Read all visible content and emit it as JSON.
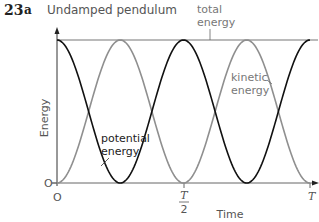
{
  "figure": {
    "number": "23",
    "part": "a",
    "title": "Undamped pendulum"
  },
  "chart_data": {
    "type": "line",
    "title": "Undamped pendulum",
    "xlabel": "Time",
    "ylabel": "Energy",
    "x_ticks": [
      "O",
      "T/2",
      "T"
    ],
    "y_ticks": [
      "O"
    ],
    "xlim": [
      0,
      1
    ],
    "ylim": [
      0,
      1
    ],
    "x_unit": "T (period)",
    "grid": false,
    "legend": "inline annotations",
    "x": [
      0,
      0.0625,
      0.125,
      0.1875,
      0.25,
      0.3125,
      0.375,
      0.4375,
      0.5,
      0.5625,
      0.625,
      0.6875,
      0.75,
      0.8125,
      0.875,
      0.9375,
      1.0
    ],
    "series": [
      {
        "name": "total energy",
        "color": "#666666",
        "values": [
          1,
          1,
          1,
          1,
          1,
          1,
          1,
          1,
          1,
          1,
          1,
          1,
          1,
          1,
          1,
          1,
          1
        ]
      },
      {
        "name": "potential energy",
        "color": "#111111",
        "values": [
          1,
          0.854,
          0.5,
          0.146,
          0,
          0.146,
          0.5,
          0.854,
          1,
          0.854,
          0.5,
          0.146,
          0,
          0.146,
          0.5,
          0.854,
          1
        ]
      },
      {
        "name": "kinetic energy",
        "color": "#8a8a8a",
        "values": [
          0,
          0.146,
          0.5,
          0.854,
          1,
          0.854,
          0.5,
          0.146,
          0,
          0.146,
          0.5,
          0.854,
          1,
          0.854,
          0.5,
          0.146,
          0
        ]
      }
    ],
    "annotations": [
      {
        "text": "total energy",
        "target": "total energy"
      },
      {
        "text": "kinetic energy",
        "target": "kinetic energy"
      },
      {
        "text": "potential energy",
        "target": "potential energy"
      }
    ]
  },
  "labels": {
    "total_1": "total",
    "total_2": "energy",
    "kinetic_1": "kinetic",
    "kinetic_2": "energy",
    "potential_1": "potential",
    "potential_2": "energy",
    "xlabel": "Time",
    "ylabel": "Energy",
    "origin_x": "O",
    "origin_y": "O",
    "half_T_num": "T",
    "half_T_den": "2",
    "T": "T"
  }
}
